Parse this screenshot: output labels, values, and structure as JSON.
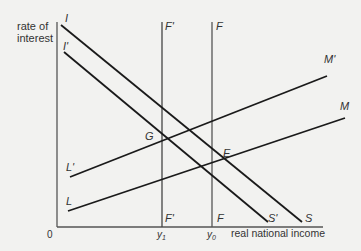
{
  "diagram": {
    "type": "IS-LM-BP style macroeconomic diagram",
    "axes": {
      "y_label_line1": "rate of",
      "y_label_line2": "interest",
      "x_label": "real national income",
      "origin": "0"
    },
    "curves": {
      "I": "I",
      "I_prime": "I'",
      "S": "S",
      "S_prime": "S'",
      "M": "M",
      "M_prime": "M'",
      "L": "L",
      "L_prime": "L'",
      "F_top": "F",
      "F_bottom": "F",
      "F_prime_top": "F'",
      "F_prime_bottom": "F'"
    },
    "points": {
      "G": "G",
      "E": "E"
    },
    "x_ticks": {
      "y1": "y",
      "y1_sub": "1",
      "y0": "y",
      "y0_sub": "0"
    },
    "colors": {
      "line": "#1a1a1a",
      "axis": "#555555",
      "background": "#f2f2f0",
      "text": "#333333"
    }
  }
}
